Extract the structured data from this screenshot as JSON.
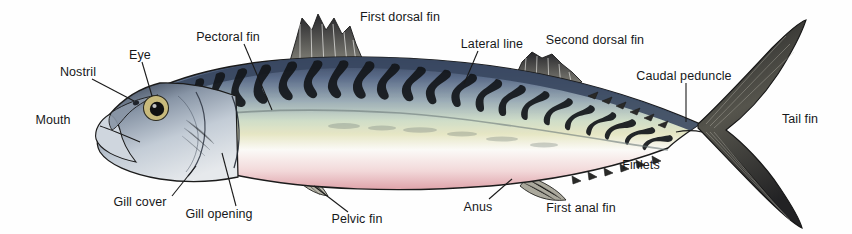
{
  "diagram": {
    "kind": "external anatomy illustration",
    "width": 852,
    "height": 234,
    "background_color": "#fefefe",
    "label_text_color": "#16181a",
    "leader_line_color": "#1a1a1a"
  },
  "palette": {
    "dorsal_dark_blue": "#3c4a63",
    "dorsal_mid_blue": "#7b8ca8",
    "stripe_black": "#15181c",
    "flank_pale_green": "#d8e2cc",
    "flank_pale_yellow": "#e9e7c8",
    "belly_white": "#fbfafa",
    "belly_pink": "#e9b9bd",
    "belly_rose": "#d98f98",
    "fin_dark": "#3a3a36",
    "fin_grey": "#8d8c84",
    "head_silver": "#b9c2cd",
    "head_shadow": "#6f7b8a",
    "eye_ring_gold": "#c9b977",
    "eye_pupil": "#111111",
    "outline": "#1b1b1b"
  },
  "labels": [
    {
      "id": "nostril",
      "text": "Nostril",
      "x": 78,
      "y": 72,
      "align": "center",
      "leader": [
        [
          92,
          79
        ],
        [
          134,
          101
        ]
      ]
    },
    {
      "id": "eye",
      "text": "Eye",
      "x": 140,
      "y": 55,
      "align": "center",
      "leader": [
        [
          142,
          62
        ],
        [
          152,
          96
        ]
      ]
    },
    {
      "id": "mouth",
      "text": "Mouth",
      "x": 53,
      "y": 120,
      "align": "center",
      "leader": []
    },
    {
      "id": "pectoral-fin",
      "text": "Pectoral fin",
      "x": 228,
      "y": 37,
      "align": "center",
      "leader": [
        [
          244,
          44
        ],
        [
          272,
          110
        ]
      ]
    },
    {
      "id": "first-dorsal-fin",
      "text": "First dorsal fin",
      "x": 400,
      "y": 17,
      "align": "center",
      "leader": []
    },
    {
      "id": "lateral-line",
      "text": "Lateral line",
      "x": 492,
      "y": 44,
      "align": "center",
      "leader": [
        [
          478,
          51
        ],
        [
          464,
          84
        ]
      ]
    },
    {
      "id": "second-dorsal-fin",
      "text": "Second dorsal fin",
      "x": 595,
      "y": 40,
      "align": "center",
      "leader": []
    },
    {
      "id": "caudal-peduncle",
      "text": "Caudal peduncle",
      "x": 684,
      "y": 76,
      "align": "center",
      "leader": [
        [
          686,
          83
        ],
        [
          686,
          122
        ]
      ]
    },
    {
      "id": "tail-fin",
      "text": "Tail fin",
      "x": 800,
      "y": 119,
      "align": "center",
      "leader": []
    },
    {
      "id": "gill-cover",
      "text": "Gill cover",
      "x": 140,
      "y": 202,
      "align": "center",
      "leader": [
        [
          172,
          196
        ],
        [
          196,
          166
        ]
      ]
    },
    {
      "id": "gill-opening",
      "text": "Gill opening",
      "x": 219,
      "y": 214,
      "align": "center",
      "leader": [
        [
          236,
          206
        ],
        [
          222,
          153
        ]
      ]
    },
    {
      "id": "pelvic-fin",
      "text": "Pelvic fin",
      "x": 357,
      "y": 219,
      "align": "center",
      "leader": [
        [
          348,
          212
        ],
        [
          314,
          186
        ]
      ]
    },
    {
      "id": "anus",
      "text": "Anus",
      "x": 478,
      "y": 207,
      "align": "center",
      "leader": [
        [
          489,
          199
        ],
        [
          512,
          179
        ]
      ]
    },
    {
      "id": "first-anal-fin",
      "text": "First anal fin",
      "x": 581,
      "y": 208,
      "align": "center",
      "leader": []
    },
    {
      "id": "finlets",
      "text": "Finlets",
      "x": 641,
      "y": 165,
      "align": "center",
      "leader": []
    }
  ]
}
